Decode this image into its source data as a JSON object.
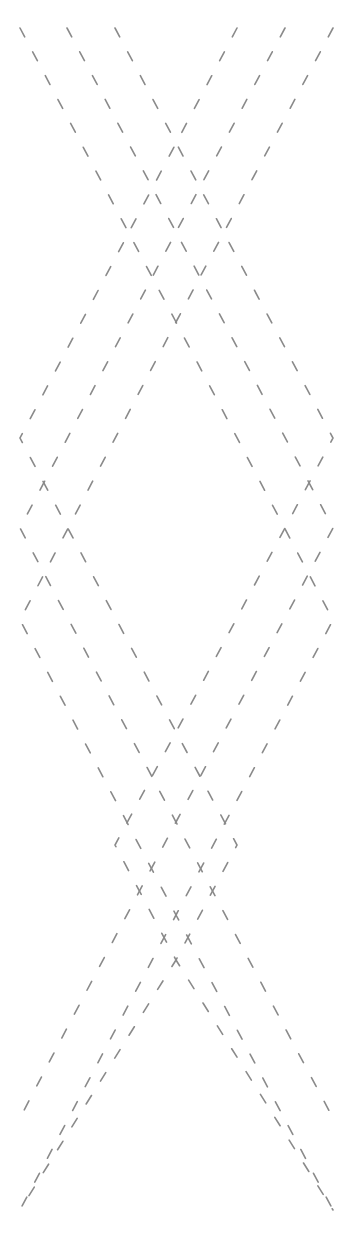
{
  "pattern": {
    "stroke_color": "#8a8a8a",
    "background": "#ffffff",
    "strands": [
      {
        "name": "strand-outer",
        "points": "20,28 176,322 333,620 176,915 20,1210"
      },
      {
        "name": "strand-middle",
        "points": "67,28 176,232 333,528 176,822 67,1028 20,1118"
      },
      {
        "name": "strand-inner",
        "points": "115,28 333,438 176,732 115,845 176,960 333,1210"
      },
      {
        "name": "strand-outer-mirror",
        "points": "333,28 176,322 20,620 176,915 333,1210"
      },
      {
        "name": "strand-middle-mirror",
        "points": "285,28 176,232 20,528 176,822 285,1028 333,1118"
      },
      {
        "name": "strand-inner-mirror",
        "points": "237,28 20,438 176,732 237,845 176,960 20,1210"
      }
    ]
  }
}
